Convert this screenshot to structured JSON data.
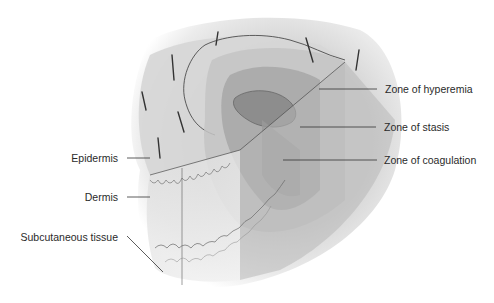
{
  "diagram": {
    "colors": {
      "background": "#ffffff",
      "skin_surface": "#d9d9d9",
      "zone_hyperemia": "#c9c9c9",
      "zone_stasis": "#a9a9a9",
      "zone_coagulation": "#8f8f8f",
      "outline": "#3a3a3a",
      "label_text": "#2a2a2a"
    },
    "labels_left": [
      {
        "id": "epidermis",
        "text": "Epidermis"
      },
      {
        "id": "dermis",
        "text": "Dermis"
      },
      {
        "id": "subcutaneous",
        "text": "Subcutaneous tissue"
      }
    ],
    "labels_right": [
      {
        "id": "hyperemia",
        "text": "Zone of hyperemia"
      },
      {
        "id": "stasis",
        "text": "Zone of stasis"
      },
      {
        "id": "coagulation",
        "text": "Zone of coagulation"
      }
    ]
  }
}
